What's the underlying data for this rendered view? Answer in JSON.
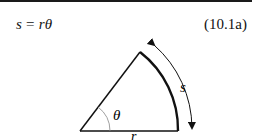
{
  "equation": {
    "lhs": "s",
    "equals": "=",
    "rhs": "rθ",
    "number": "(10.1a)"
  },
  "diagram": {
    "type": "circular-sector",
    "labels": {
      "angle": "θ",
      "radius": "r",
      "arc": "s"
    },
    "arrow": "double-headed curved arrow along arc"
  }
}
